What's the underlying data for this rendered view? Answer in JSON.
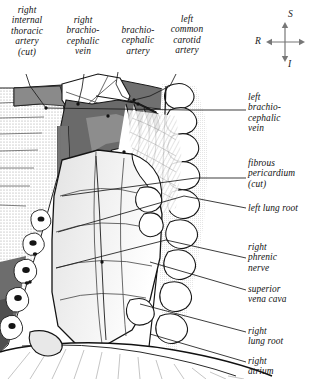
{
  "figure": {
    "kind": "anatomical-illustration",
    "palette": {
      "background": "#ffffff",
      "ink": "#111111",
      "vessel_dark": "#5a5a5a",
      "vessel_mid": "#8e8e8e",
      "stipple": "#bdbdbd",
      "pale": "#f2f2f2"
    }
  },
  "orientation": {
    "name": "orientation-compass",
    "superior": "S",
    "right": "R",
    "inferior": "I"
  },
  "labels_top": [
    {
      "id": "right-internal-thoracic-artery",
      "text": "right\ninternal\nthoracic\nartery\n(cut)"
    },
    {
      "id": "right-brachiocephalic-vein",
      "text": "right\nbrachio-\ncephalic\nvein"
    },
    {
      "id": "brachiocephalic-artery",
      "text": "brachio-\ncephalic\nartery"
    },
    {
      "id": "left-common-carotid-artery",
      "text": "left\ncommon\ncarotid\nartery"
    }
  ],
  "labels_right": [
    {
      "id": "left-brachiocephalic-vein",
      "text": "left\nbrachio-\ncephalic\nvein"
    },
    {
      "id": "fibrous-pericardium",
      "text": "fibrous\npericardium\n(cut)"
    },
    {
      "id": "left-lung-root",
      "text": "left lung root"
    },
    {
      "id": "right-phrenic-nerve",
      "text": "right\nphrenic\nnerve"
    },
    {
      "id": "superior-vena-cava",
      "text": "superior\nvena cava"
    },
    {
      "id": "right-lung-root",
      "text": "right\nlung root"
    },
    {
      "id": "right-atrium",
      "text": "right\natrium"
    }
  ]
}
